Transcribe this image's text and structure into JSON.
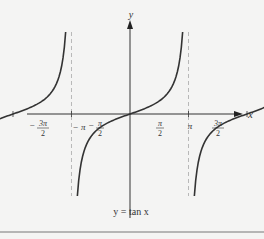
{
  "chart_data": {
    "type": "line",
    "title": "",
    "caption": "y = tan x",
    "function": "tan(x)",
    "xlabel": "x",
    "ylabel": "y",
    "x_ticks": [
      {
        "value": -4.712,
        "label_num": "3π",
        "label_den": "2",
        "sign": "−"
      },
      {
        "value": -3.1416,
        "label": "− π"
      },
      {
        "value": -1.5708,
        "label_num": "π",
        "label_den": "2",
        "sign": "−"
      },
      {
        "value": 1.5708,
        "label_num": "π",
        "label_den": "2",
        "sign": ""
      },
      {
        "value": 3.1416,
        "label": "π"
      },
      {
        "value": 4.712,
        "label_num": "3π",
        "label_den": "2",
        "sign": ""
      }
    ],
    "asymptotes": [
      -4.712,
      -1.5708,
      1.5708,
      4.712
    ],
    "branches": [
      [
        -4.712,
        -1.5708
      ],
      [
        -1.5708,
        1.5708
      ],
      [
        1.5708,
        4.712
      ]
    ],
    "xlim": [
      -5.6,
      6.6
    ],
    "ylim": [
      -3.4,
      3.4
    ],
    "grid": false,
    "colors": {
      "curve": "#333333",
      "axis": "#333333",
      "asymptote": "#a8a8a8",
      "border": "#777777"
    }
  },
  "labels": {
    "x_axis": "x",
    "y_axis": "y",
    "caption": "y = tan x",
    "neg_pi": "− π",
    "pi": "π",
    "neg_sign": "−",
    "pi_sym": "π",
    "three_pi": "3π",
    "two": "2"
  }
}
